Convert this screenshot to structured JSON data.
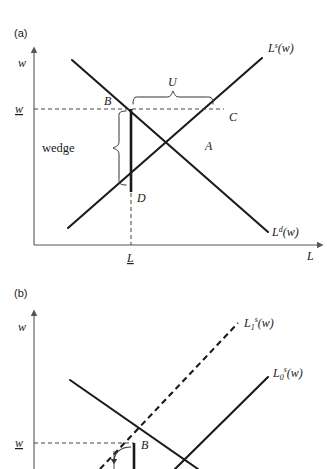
{
  "figure": {
    "panels": [
      {
        "id": "a",
        "label": "(a)",
        "axes": {
          "y_label": "w",
          "x_label": "L"
        },
        "ticks": {
          "y_tick": "w",
          "x_tick": "L"
        },
        "curves": [
          {
            "name": "labor-supply",
            "label_L": "L",
            "label_sup": "s",
            "label_arg": "(w)",
            "style": "solid"
          },
          {
            "name": "labor-demand",
            "label_L": "L",
            "label_sup": "d",
            "label_arg": "(w)",
            "style": "solid"
          }
        ],
        "points": [
          {
            "name": "point-A",
            "label": "A"
          },
          {
            "name": "point-B",
            "label": "B"
          },
          {
            "name": "point-C",
            "label": "C"
          },
          {
            "name": "point-D",
            "label": "D"
          }
        ],
        "annotations": [
          {
            "name": "unemployment-brace",
            "label": "U"
          },
          {
            "name": "wedge-brace",
            "label": "wedge"
          }
        ]
      },
      {
        "id": "b",
        "label": "(b)",
        "axes": {
          "y_label": "w",
          "x_label": "L"
        },
        "ticks": {
          "y_tick": "w"
        },
        "curves": [
          {
            "name": "labor-supply-1",
            "label_L": "L",
            "label_sup": "s",
            "label_sub": "1",
            "label_arg": "(w)",
            "style": "dashed"
          },
          {
            "name": "labor-supply-0",
            "label_L": "L",
            "label_sup": "s",
            "label_sub": "0",
            "label_arg": "(w)",
            "style": "solid"
          },
          {
            "name": "labor-demand",
            "label_L": "L",
            "label_sup": "d",
            "label_arg": "(w)",
            "style": "solid"
          }
        ],
        "points": [
          {
            "name": "point-B",
            "label": "B"
          }
        ]
      }
    ],
    "colors": {
      "curve": "#1a1a1a",
      "axis": "#555555",
      "guide": "#444444",
      "background": "#ffffff"
    }
  }
}
